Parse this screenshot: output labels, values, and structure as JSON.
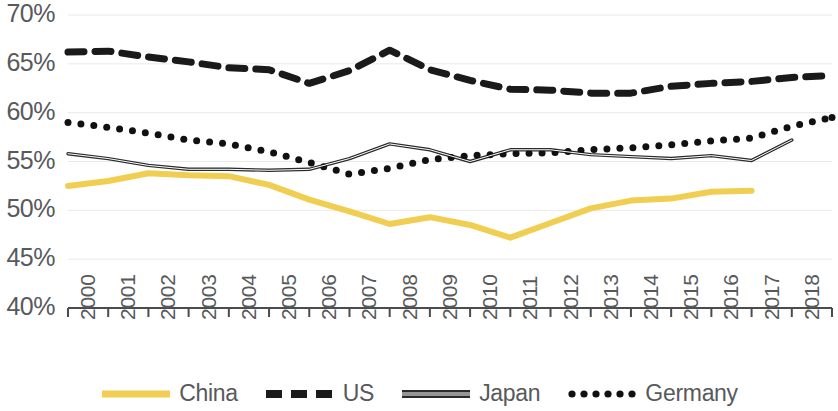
{
  "chart_data": {
    "type": "line",
    "title": "",
    "subtitle": "",
    "xlabel": "",
    "ylabel": "",
    "grid": true,
    "legend_position": "bottom",
    "x": [
      2000,
      2001,
      2002,
      2003,
      2004,
      2005,
      2006,
      2007,
      2008,
      2009,
      2010,
      2011,
      2012,
      2013,
      2014,
      2015,
      2016,
      2017,
      2018,
      2019
    ],
    "xtick_labels": [
      "2000",
      "2001",
      "2002",
      "2003",
      "2004",
      "2005",
      "2006",
      "2007",
      "2008",
      "2009",
      "2010",
      "2011",
      "2012",
      "2013",
      "2014",
      "2015",
      "2016",
      "2017",
      "2018",
      "2019"
    ],
    "ytick_labels": [
      "70%",
      "65%",
      "60%",
      "55%",
      "50%",
      "45%",
      "40%"
    ],
    "ytick_values": [
      70,
      65,
      60,
      55,
      50,
      45,
      40
    ],
    "ylim": [
      40,
      70
    ],
    "xlim": [
      2000,
      2019
    ],
    "series": [
      {
        "name": "China",
        "color": "#F0CE51",
        "style": "solid",
        "values": [
          52.5,
          53.0,
          53.8,
          53.6,
          53.5,
          52.6,
          51.1,
          49.9,
          48.6,
          49.3,
          48.5,
          47.2,
          48.7,
          50.2,
          51.0,
          51.2,
          51.9,
          52.0,
          null,
          null
        ]
      },
      {
        "name": "US",
        "color": "#1A1A1A",
        "style": "dashed",
        "values": [
          66.2,
          66.3,
          65.7,
          65.2,
          64.6,
          64.4,
          63.0,
          64.3,
          66.4,
          64.4,
          63.3,
          62.4,
          62.3,
          62.0,
          62.0,
          62.7,
          63.0,
          63.2,
          63.6,
          63.8
        ]
      },
      {
        "name": "Japan",
        "color": "#2B2B2B",
        "style": "solid-thin",
        "values": [
          55.8,
          55.3,
          54.6,
          54.2,
          54.2,
          54.1,
          54.2,
          55.3,
          56.8,
          56.2,
          55.0,
          56.2,
          56.2,
          55.7,
          55.5,
          55.3,
          55.6,
          55.1,
          57.2,
          null
        ]
      },
      {
        "name": "Germany",
        "color": "#111111",
        "style": "dotted",
        "values": [
          59.0,
          58.5,
          57.9,
          57.2,
          56.8,
          56.0,
          54.9,
          53.7,
          54.3,
          55.2,
          55.6,
          55.8,
          55.9,
          56.2,
          56.4,
          56.7,
          57.1,
          57.4,
          58.6,
          59.5
        ]
      }
    ]
  },
  "legend": {
    "items": [
      {
        "label": "China",
        "key": "china"
      },
      {
        "label": "US",
        "key": "us"
      },
      {
        "label": "Japan",
        "key": "japan"
      },
      {
        "label": "Germany",
        "key": "germany"
      }
    ]
  }
}
